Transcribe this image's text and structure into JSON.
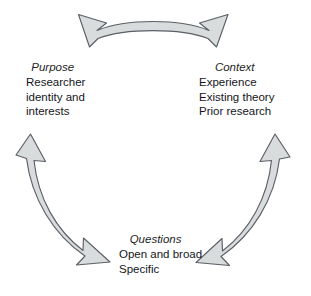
{
  "diagram": {
    "type": "cyclical-three-node-diagram",
    "background_color": "#ffffff",
    "arrow_fill_color": "#d9dcdc",
    "arrow_stroke_color": "#5b5f66",
    "text_color": "#15151c",
    "nodes": [
      {
        "id": "purpose",
        "title": "Purpose",
        "lines": [
          "Researcher",
          "identity and",
          "interests"
        ]
      },
      {
        "id": "context",
        "title": "Context",
        "lines": [
          "Experience",
          "Existing theory",
          "Prior research"
        ]
      },
      {
        "id": "questions",
        "title": "Questions",
        "lines": [
          "Open and broad",
          "Specific"
        ]
      }
    ],
    "connectors": [
      {
        "id": "purpose-context",
        "name": "top-double-arrow",
        "from": "purpose",
        "to": "context",
        "bidirectional": true,
        "position": "top"
      },
      {
        "id": "purpose-questions",
        "name": "left-double-arrow",
        "from": "questions",
        "to": "purpose",
        "bidirectional": true,
        "position": "left"
      },
      {
        "id": "questions-context",
        "name": "right-double-arrow",
        "from": "questions",
        "to": "context",
        "bidirectional": true,
        "position": "right"
      }
    ]
  }
}
